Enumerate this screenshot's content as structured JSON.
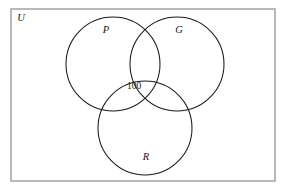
{
  "figure": {
    "type": "venn-diagram",
    "sets_count": 3,
    "background_color": "#ffffff"
  },
  "universe": {
    "label": "U",
    "stroke_color": "#8a8a8a",
    "stroke_width": 1.2,
    "x": 11,
    "y": 9,
    "width": 264,
    "height": 172,
    "label_x": 21,
    "label_y": 19
  },
  "circles": [
    {
      "key": "P",
      "label": "P",
      "cx": 113,
      "cy": 64,
      "r": 47,
      "label_x": 106,
      "label_y": 31,
      "stroke_color": "#1a1a1a",
      "stroke_width": 1.05
    },
    {
      "key": "G",
      "label": "G",
      "cx": 177,
      "cy": 64,
      "r": 47,
      "label_x": 179,
      "label_y": 31,
      "stroke_color": "#1a1a1a",
      "stroke_width": 1.05
    },
    {
      "key": "R",
      "label": "R",
      "cx": 145,
      "cy": 128,
      "r": 47,
      "label_x": 146,
      "label_y": 158,
      "stroke_color": "#1a1a1a",
      "stroke_width": 1.05
    }
  ],
  "regions": [
    {
      "key": "P-and-G-and-R",
      "value": "100",
      "x": 134,
      "y": 87
    }
  ],
  "chart_data": {
    "type": "venn",
    "title": "",
    "sets": [
      "P",
      "G",
      "R"
    ],
    "universe_label": "U",
    "region_values": [
      {
        "sets": [
          "P",
          "G",
          "R"
        ],
        "label": "100",
        "value": 100
      }
    ],
    "unlabeled_regions": [
      "P",
      "G",
      "R",
      "P∩G",
      "P∩R",
      "G∩R",
      "outside"
    ],
    "legend": "none",
    "grid": false
  }
}
